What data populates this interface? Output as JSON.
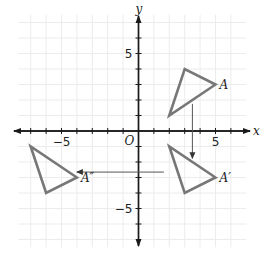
{
  "diagram": {
    "type": "coordinate-plane-transformations",
    "axes": {
      "x_label": "x",
      "y_label": "y",
      "origin_label": "O",
      "x_tick_labels": [
        {
          "value": -5,
          "text": "−5"
        },
        {
          "value": 5,
          "text": "5"
        }
      ],
      "y_tick_labels": [
        {
          "value": 5,
          "text": "5"
        },
        {
          "value": -5,
          "text": "−5"
        }
      ],
      "x_range": [
        -7,
        6
      ],
      "y_range": [
        -6,
        6
      ]
    },
    "shapes": [
      {
        "name": "triangle-A",
        "label": "A",
        "vertices": [
          [
            2,
            1
          ],
          [
            3,
            4
          ],
          [
            5,
            3
          ]
        ],
        "label_vertex": [
          5,
          3
        ]
      },
      {
        "name": "triangle-A-prime",
        "label": "A′",
        "vertices": [
          [
            2,
            -1
          ],
          [
            3,
            -4
          ],
          [
            5,
            -3
          ]
        ],
        "label_vertex": [
          5,
          -3
        ]
      },
      {
        "name": "triangle-A-double-prime",
        "label": "A″",
        "vertices": [
          [
            -7,
            -1
          ],
          [
            -6,
            -4
          ],
          [
            -4,
            -3
          ]
        ],
        "label_vertex": [
          -4,
          -3
        ]
      }
    ],
    "arrows": [
      {
        "name": "reflection-arrow",
        "from": [
          3.5,
          1.75
        ],
        "to": [
          3.5,
          -1.75
        ]
      },
      {
        "name": "translation-arrow",
        "from": [
          1.65,
          -2.65
        ],
        "to": [
          -4,
          -2.65
        ]
      }
    ],
    "colors": {
      "triangle_stroke": "#777777",
      "axis": "#1a1a1a",
      "grid": "#ececec",
      "arrow": "#555555"
    }
  }
}
